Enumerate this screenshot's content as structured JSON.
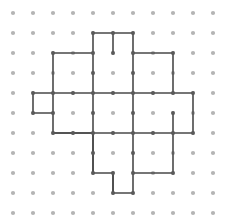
{
  "figure": {
    "background_color": "#ffffff",
    "dot_color": "#b4b4b4",
    "line_color": "#4a4a4a",
    "vertex_color": "#5a5a5a",
    "line_width": 1.6,
    "dot_radius": 2.1,
    "vertex_radius": 1.9
  },
  "grid": {
    "origin_x": 13,
    "origin_y": 13,
    "spacing": 20,
    "columns": 11,
    "rows": 11,
    "col_indices": [
      0,
      1,
      2,
      3,
      4,
      5,
      6,
      7,
      8,
      9,
      10
    ],
    "row_indices": [
      0,
      1,
      2,
      3,
      4,
      5,
      6,
      7,
      8,
      9,
      10
    ]
  },
  "chart_data": {
    "type": "scatter",
    "title": "",
    "xlabel": "",
    "ylabel": "",
    "xlim": [
      0,
      10
    ],
    "ylim": [
      0,
      10
    ],
    "grid": true,
    "legend": "none",
    "shape_name": "cross-with-four-square-tabs",
    "shape_vertices_grid": [
      [
        5,
        1
      ],
      [
        6,
        1
      ],
      [
        6,
        2
      ],
      [
        8,
        2
      ],
      [
        8,
        4
      ],
      [
        9,
        4
      ],
      [
        9,
        6
      ],
      [
        8,
        6
      ],
      [
        8,
        8
      ],
      [
        6,
        8
      ],
      [
        6,
        9
      ],
      [
        5,
        9
      ],
      [
        5,
        8
      ],
      [
        4,
        8
      ],
      [
        4,
        6
      ],
      [
        2,
        6
      ],
      [
        2,
        5
      ],
      [
        1,
        5
      ],
      [
        1,
        4
      ],
      [
        2,
        4
      ],
      [
        2,
        2
      ],
      [
        4,
        2
      ],
      [
        4,
        1
      ]
    ],
    "outline_path_pixels": "M113,33 L133,33 L133,53 L173,53 L173,93 L193,93 L193,133 L173,133 L173,173 L133,173 L133,193 L113,193 L113,173 L93,173 L93,133 L53,133 L53,113 L33,113 L33,93 L53,93 L53,53 L93,53 L93,33 Z",
    "internal_segments_grid": [
      {
        "name": "vertical-bar-left-edge",
        "from": [
          4,
          2
        ],
        "to": [
          4,
          8
        ]
      },
      {
        "name": "vertical-bar-right-edge",
        "from": [
          6,
          2
        ],
        "to": [
          6,
          8
        ]
      },
      {
        "name": "horizontal-bar-top-edge",
        "from": [
          2,
          4
        ],
        "to": [
          8,
          4
        ]
      },
      {
        "name": "horizontal-bar-bottom-edge",
        "from": [
          2,
          6
        ],
        "to": [
          8,
          6
        ]
      },
      {
        "name": "left-tab-divider",
        "from": [
          2,
          4
        ],
        "to": [
          2,
          5
        ]
      },
      {
        "name": "right-tab-divider",
        "from": [
          8,
          5
        ],
        "to": [
          8,
          6
        ]
      },
      {
        "name": "top-tab-divider",
        "from": [
          5,
          1
        ],
        "to": [
          5,
          2
        ]
      },
      {
        "name": "bottom-tab-divider",
        "from": [
          5,
          8
        ],
        "to": [
          5,
          9
        ]
      }
    ],
    "parts": [
      {
        "name": "top-tab",
        "cols": [
          5,
          6
        ],
        "rows": [
          1,
          2
        ]
      },
      {
        "name": "vertical-bar",
        "cols": [
          4,
          6
        ],
        "rows": [
          2,
          8
        ]
      },
      {
        "name": "horizontal-bar",
        "cols": [
          2,
          8
        ],
        "rows": [
          4,
          6
        ]
      },
      {
        "name": "left-tab",
        "cols": [
          1,
          2
        ],
        "rows": [
          4,
          5
        ]
      },
      {
        "name": "right-tab",
        "cols": [
          8,
          9
        ],
        "rows": [
          5,
          6
        ]
      },
      {
        "name": "bottom-tab",
        "cols": [
          5,
          6
        ],
        "rows": [
          8,
          9
        ]
      }
    ]
  }
}
